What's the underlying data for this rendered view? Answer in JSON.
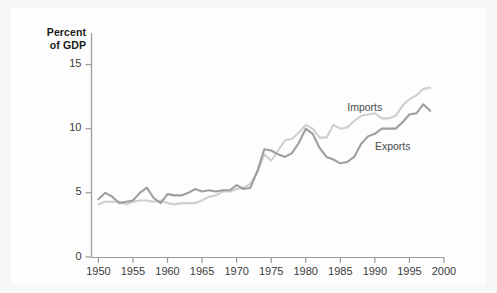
{
  "figure": {
    "background_color": "#f7f7f7",
    "panel_color": "#fdfdfd"
  },
  "chart_data": {
    "type": "line",
    "title": "",
    "subtitle": "",
    "xlabel": "",
    "ylabel": "Percent\nof GDP",
    "ylabel_line1": "Percent",
    "ylabel_line2": "of GDP",
    "xlim": [
      1949,
      2000
    ],
    "ylim": [
      0,
      16.5
    ],
    "grid": false,
    "legend_position": "inline-annotations",
    "xticks": [
      1950,
      1955,
      1960,
      1965,
      1970,
      1975,
      1980,
      1985,
      1990,
      1995,
      2000
    ],
    "xtick_labels": [
      "1950",
      "1955",
      "1960",
      "1965",
      "1970",
      "1975",
      "1980",
      "1985",
      "1990",
      "1995",
      "2000"
    ],
    "yticks": [
      0,
      5,
      10,
      15
    ],
    "ytick_labels": [
      "0",
      "5",
      "10",
      "15"
    ],
    "x": [
      1950,
      1951,
      1952,
      1953,
      1954,
      1955,
      1956,
      1957,
      1958,
      1959,
      1960,
      1961,
      1962,
      1963,
      1964,
      1965,
      1966,
      1967,
      1968,
      1969,
      1970,
      1971,
      1972,
      1973,
      1974,
      1975,
      1976,
      1977,
      1978,
      1979,
      1980,
      1981,
      1982,
      1983,
      1984,
      1985,
      1986,
      1987,
      1988,
      1989,
      1990,
      1991,
      1992,
      1993,
      1994,
      1995,
      1996,
      1997,
      1998
    ],
    "series": [
      {
        "name": "Imports",
        "color": "#cfcfcf",
        "label_x": 1986,
        "label_y": 11.6,
        "values": [
          4.1,
          4.3,
          4.3,
          4.3,
          4.1,
          4.3,
          4.4,
          4.4,
          4.3,
          4.4,
          4.2,
          4.1,
          4.2,
          4.2,
          4.2,
          4.4,
          4.7,
          4.8,
          5.1,
          5.1,
          5.3,
          5.4,
          5.7,
          6.6,
          8.0,
          7.5,
          8.3,
          9.1,
          9.2,
          9.7,
          10.3,
          10.0,
          9.3,
          9.3,
          10.3,
          10.0,
          10.1,
          10.6,
          11.0,
          11.1,
          11.2,
          10.8,
          10.8,
          11.0,
          11.8,
          12.3,
          12.6,
          13.1,
          13.2
        ]
      },
      {
        "name": "Exports",
        "color": "#9e9e9e",
        "label_x": 1990,
        "label_y": 8.6,
        "values": [
          4.5,
          5.0,
          4.7,
          4.2,
          4.3,
          4.4,
          5.0,
          5.4,
          4.6,
          4.2,
          4.9,
          4.8,
          4.8,
          5.0,
          5.3,
          5.1,
          5.2,
          5.1,
          5.2,
          5.2,
          5.6,
          5.3,
          5.4,
          6.7,
          8.4,
          8.3,
          8.0,
          7.8,
          8.1,
          8.9,
          10.0,
          9.6,
          8.5,
          7.8,
          7.6,
          7.3,
          7.4,
          7.8,
          8.8,
          9.4,
          9.6,
          10.0,
          10.0,
          10.0,
          10.5,
          11.1,
          11.2,
          11.9,
          11.4
        ]
      }
    ]
  }
}
